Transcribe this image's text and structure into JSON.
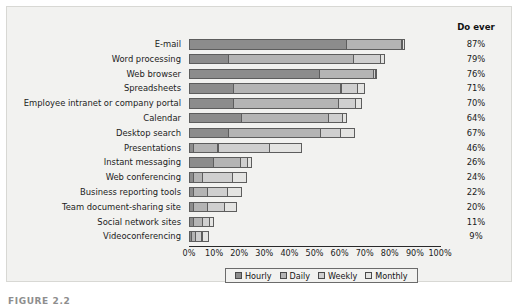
{
  "figure": {
    "caption": "FIGURE 2.2",
    "doever_header": "Do ever"
  },
  "chart_data": {
    "type": "bar",
    "subtype": "stacked-horizontal",
    "title": "",
    "xlabel": "",
    "ylabel": "",
    "xlim": [
      0,
      100
    ],
    "xtick_labels": [
      "0%",
      "10%",
      "20%",
      "30%",
      "40%",
      "50%",
      "60%",
      "70%",
      "80%",
      "90%",
      "100%"
    ],
    "xticks": [
      0,
      10,
      20,
      30,
      40,
      50,
      60,
      70,
      80,
      90,
      100
    ],
    "grid": false,
    "legend_position": "bottom",
    "legend": [
      "Hourly",
      "Daily",
      "Weekly",
      "Monthly"
    ],
    "series_colors": [
      "#8c8c8c",
      "#b4b4b4",
      "#cfcfcf",
      "#e4e4e2"
    ],
    "categories": [
      "E-mail",
      "Word processing",
      "Web browser",
      "Spreadsheets",
      "Employee intranet or company portal",
      "Calendar",
      "Desktop search",
      "Presentations",
      "Instant messaging",
      "Web conferencing",
      "Business reporting tools",
      "Team document-sharing site",
      "Social network sites",
      "Videoconferencing"
    ],
    "series": [
      {
        "name": "Hourly",
        "values": [
          63,
          16,
          52,
          18,
          18,
          21,
          16,
          2,
          10,
          2,
          2,
          2,
          2,
          1
        ]
      },
      {
        "name": "Daily",
        "values": [
          22,
          50,
          22,
          43,
          42,
          35,
          37,
          10,
          11,
          4,
          6,
          6,
          4,
          2
        ]
      },
      {
        "name": "Weekly",
        "values": [
          1,
          11,
          1,
          7,
          7,
          6,
          8,
          21,
          3,
          12,
          8,
          7,
          3,
          3
        ]
      },
      {
        "name": "Monthly",
        "values": [
          1,
          2,
          1,
          3,
          3,
          2,
          6,
          13,
          2,
          6,
          6,
          5,
          2,
          3
        ]
      }
    ],
    "do_ever": [
      "87%",
      "79%",
      "76%",
      "71%",
      "70%",
      "64%",
      "67%",
      "46%",
      "26%",
      "24%",
      "22%",
      "20%",
      "11%",
      "9%"
    ]
  }
}
